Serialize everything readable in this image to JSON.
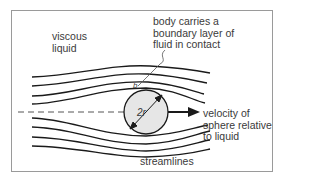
{
  "diagram": {
    "labels": {
      "medium": "viscous\nliquid",
      "boundary_layer": "body carries a\nboundary layer of\nfluid in contact",
      "velocity": "velocity of\nsphere relative\nto liquid",
      "streamlines": "streamlines",
      "diameter": "2r",
      "boundary_marker": "b"
    },
    "colors": {
      "sphere_fill": "#e6e6e6",
      "line": "#1a1a1a",
      "frame": "#9a9a9a",
      "text": "#3a3a3a"
    }
  }
}
